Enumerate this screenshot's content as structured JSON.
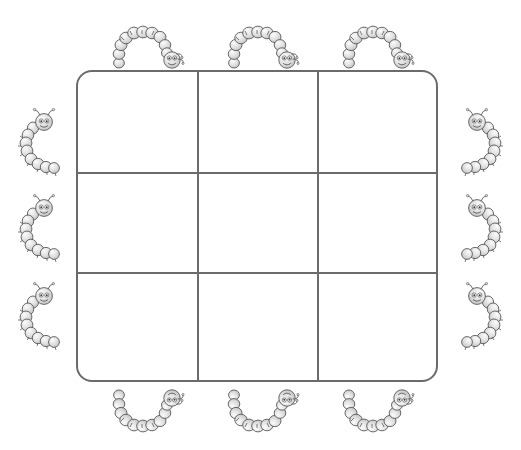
{
  "page": {
    "background_color": "#ffffff"
  },
  "board": {
    "name": "tic-tac-toe-grid",
    "rows": 3,
    "columns": 3,
    "border_color": "#6b6b6b",
    "border_width_px": 2.2,
    "corner_radius_px": 16,
    "fill_color": "#ffffff",
    "left_px": 76,
    "top_px": 70,
    "width_px": 362,
    "height_px": 312,
    "vertical_line_offsets_px": [
      119,
      239
    ],
    "horizontal_line_offsets_px": [
      100,
      200
    ],
    "cells": [
      {
        "row": 1,
        "col": 1,
        "label": ""
      },
      {
        "row": 1,
        "col": 2,
        "label": ""
      },
      {
        "row": 1,
        "col": 3,
        "label": ""
      },
      {
        "row": 2,
        "col": 1,
        "label": ""
      },
      {
        "row": 2,
        "col": 2,
        "label": ""
      },
      {
        "row": 2,
        "col": 3,
        "label": ""
      },
      {
        "row": 3,
        "col": 1,
        "label": ""
      },
      {
        "row": 3,
        "col": 2,
        "label": ""
      },
      {
        "row": 3,
        "col": 3,
        "label": ""
      }
    ]
  },
  "caterpillars": {
    "count": 12,
    "body_color": "#d9d9d9",
    "outline_color": "#555555",
    "highlight_color": "#f2f2f2",
    "groups": [
      {
        "side": "top",
        "count": 3,
        "icon": "caterpillar-arch-icon",
        "orientation": "arch-head-right"
      },
      {
        "side": "bottom",
        "count": 3,
        "icon": "caterpillar-u-icon",
        "orientation": "u-head-right"
      },
      {
        "side": "left",
        "count": 3,
        "icon": "caterpillar-c-icon",
        "orientation": "c-head-top-right"
      },
      {
        "side": "right",
        "count": 3,
        "icon": "caterpillar-c-flip-icon",
        "orientation": "reverse-c-head-top-left"
      }
    ],
    "items": [
      {
        "id": "top-1",
        "side": "top",
        "index": 1,
        "left_px": 111,
        "top_px": 22
      },
      {
        "id": "top-2",
        "side": "top",
        "index": 2,
        "left_px": 226,
        "top_px": 22
      },
      {
        "id": "top-3",
        "side": "top",
        "index": 3,
        "left_px": 341,
        "top_px": 22
      },
      {
        "id": "bottom-1",
        "side": "bottom",
        "index": 1,
        "left_px": 111,
        "top_px": 384
      },
      {
        "id": "bottom-2",
        "side": "bottom",
        "index": 2,
        "left_px": 226,
        "top_px": 384
      },
      {
        "id": "bottom-3",
        "side": "bottom",
        "index": 3,
        "left_px": 341,
        "top_px": 384
      },
      {
        "id": "left-1",
        "side": "left",
        "index": 1,
        "left_px": 18,
        "top_px": 104
      },
      {
        "id": "left-2",
        "side": "left",
        "index": 2,
        "left_px": 18,
        "top_px": 190
      },
      {
        "id": "left-3",
        "side": "left",
        "index": 3,
        "left_px": 18,
        "top_px": 278
      },
      {
        "id": "right-1",
        "side": "right",
        "index": 1,
        "left_px": 451,
        "top_px": 104
      },
      {
        "id": "right-2",
        "side": "right",
        "index": 2,
        "left_px": 451,
        "top_px": 190
      },
      {
        "id": "right-3",
        "side": "right",
        "index": 3,
        "left_px": 451,
        "top_px": 278
      }
    ]
  }
}
